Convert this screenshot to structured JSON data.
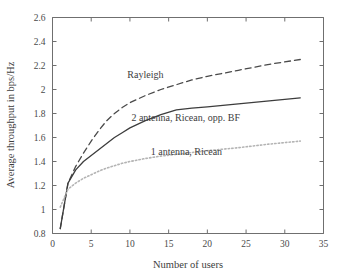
{
  "chart_data": {
    "type": "line",
    "title": "",
    "xlabel": "Number of users",
    "ylabel": "Average throughput in bps/Hz",
    "xlim": [
      0,
      35
    ],
    "ylim": [
      0.8,
      2.6
    ],
    "xticks": [
      0,
      5,
      10,
      15,
      20,
      25,
      30,
      35
    ],
    "xtick_labels": [
      "0",
      "5",
      "10",
      "15",
      "20",
      "25",
      "30",
      "35"
    ],
    "yticks": [
      0.8,
      1.0,
      1.2,
      1.4,
      1.6,
      1.8,
      2.0,
      2.2,
      2.4,
      2.6
    ],
    "ytick_labels": [
      "0.8",
      "1",
      "1.2",
      "1.4",
      "1.6",
      "1.8",
      "2",
      "2.2",
      "2.4",
      "2.6"
    ],
    "grid": false,
    "legend_position": "inline-annotations",
    "series": [
      {
        "name": "Rayleigh",
        "style": "dashed",
        "color": "#4a4a4a",
        "annotation": "Rayleigh",
        "annotation_x": 12.0,
        "annotation_y": 2.1,
        "x": [
          1,
          2,
          3,
          4,
          5,
          6,
          7,
          8,
          9,
          10,
          12,
          14,
          16,
          18,
          20,
          24,
          28,
          32
        ],
        "y": [
          0.84,
          1.22,
          1.36,
          1.47,
          1.57,
          1.66,
          1.74,
          1.8,
          1.85,
          1.89,
          1.95,
          2.0,
          2.04,
          2.08,
          2.11,
          2.16,
          2.21,
          2.25
        ]
      },
      {
        "name": "2 antenna, Ricean, opp. BF",
        "style": "solid",
        "color": "#3d3d3d",
        "annotation": "2 antenna, Ricean, opp. BF",
        "annotation_x": 17.2,
        "annotation_y": 1.735,
        "x": [
          1,
          2,
          3,
          4,
          5,
          6,
          7,
          8,
          9,
          10,
          12,
          14,
          16,
          18,
          20,
          24,
          28,
          32
        ],
        "y": [
          0.84,
          1.22,
          1.33,
          1.4,
          1.45,
          1.5,
          1.55,
          1.6,
          1.64,
          1.68,
          1.74,
          1.79,
          1.83,
          1.845,
          1.855,
          1.88,
          1.905,
          1.93
        ]
      },
      {
        "name": "1 antenna, Ricean",
        "style": "dotted",
        "color": "#b4b4b4",
        "annotation": "1 antenna, Ricean",
        "annotation_x": 17.3,
        "annotation_y": 1.455,
        "x": [
          1,
          2,
          3,
          4,
          5,
          6,
          7,
          8,
          9,
          10,
          12,
          14,
          16,
          18,
          20,
          24,
          28,
          32
        ],
        "y": [
          1.02,
          1.17,
          1.22,
          1.26,
          1.29,
          1.32,
          1.345,
          1.365,
          1.385,
          1.4,
          1.425,
          1.445,
          1.46,
          1.475,
          1.49,
          1.515,
          1.545,
          1.57
        ]
      }
    ]
  }
}
